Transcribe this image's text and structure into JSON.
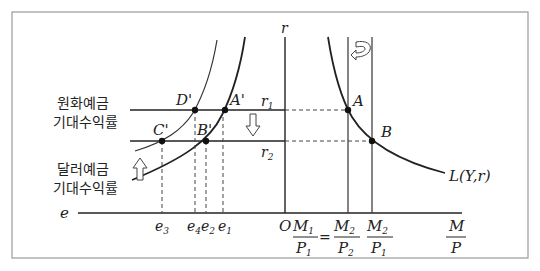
{
  "diagram": {
    "type": "economics-two-panel",
    "title": "",
    "left_panel": {
      "horizontal_axis_label": "e",
      "labels": {
        "domestic_return": [
          "원화예금",
          "기대수익률"
        ],
        "foreign_return": [
          "달러예금",
          "기대수익률"
        ]
      },
      "points": [
        "D'",
        "A'",
        "C'",
        "B'"
      ],
      "tick_labels": [
        "e3",
        "e4",
        "e2",
        "e1"
      ],
      "tick_label_main": [
        "e",
        "e",
        "e",
        "e"
      ],
      "tick_label_sub": [
        "3",
        "4",
        "2",
        "1"
      ]
    },
    "right_panel": {
      "vertical_axis_label": "r",
      "origin_label": "O",
      "rate_labels": {
        "r1_main": "r",
        "r1_sub": "1",
        "r2_main": "r",
        "r2_sub": "2"
      },
      "points": [
        "A",
        "B"
      ],
      "curve_label": "L(Y,r)",
      "x_ticks": {
        "m1p1_num": "M",
        "m1p1_num_sub": "1",
        "m1p1_den": "P",
        "m1p1_den_sub": "1",
        "equals": "=",
        "m2p2_num": "M",
        "m2p2_num_sub": "2",
        "m2p2_den": "P",
        "m2p2_den_sub": "2",
        "m2p1_num": "M",
        "m2p1_num_sub": "2",
        "m2p1_den": "P",
        "m2p1_den_sub": "1",
        "axis_num": "M",
        "axis_den": "P"
      }
    },
    "arrows": {
      "down_arrow": "shift-down",
      "up_arrow": "shift-up",
      "curved_arrow": "shift-left"
    },
    "colors": {
      "line": "#222222",
      "frame": "#9a9a9a",
      "dash": "#444444",
      "background": "#ffffff"
    }
  }
}
